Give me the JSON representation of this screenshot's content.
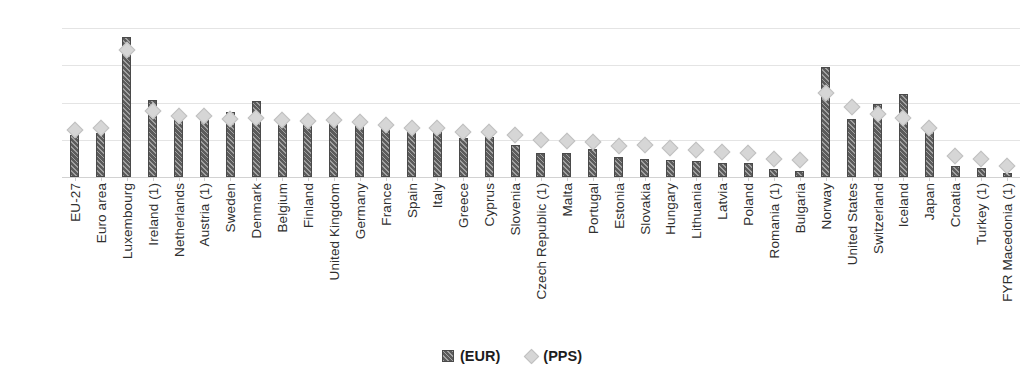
{
  "chart_data": {
    "type": "bar",
    "title": "",
    "subtitle": "",
    "xlabel": "",
    "ylabel": "",
    "ylim": [
      0,
      80000
    ],
    "grid": true,
    "legend_position": "bottom",
    "yticks": [
      "0",
      "20 000",
      "40 000",
      "60 000",
      "80 000"
    ],
    "ytick_values": [
      0,
      20000,
      40000,
      60000,
      80000
    ],
    "categories": [
      "EU-27",
      "Euro area",
      "Luxembourg",
      "Ireland (1)",
      "Netherlands",
      "Austria (1)",
      "Sweden",
      "Denmark",
      "Belgium",
      "Finland",
      "United Kingdom",
      "Germany",
      "France",
      "Spain",
      "Italy",
      "Greece",
      "Cyprus",
      "Slovenia",
      "Czech Republic (1)",
      "Malta",
      "Portugal",
      "Estonia",
      "Slovakia",
      "Hungary",
      "Lithuania",
      "Latvia",
      "Poland",
      "Romania (1)",
      "Bulgaria",
      "Norway",
      "United States",
      "Switzerland",
      "Iceland",
      "Japan",
      "Croatia",
      "Turkey (1)",
      "FYR Macedonia (1)"
    ],
    "series": [
      {
        "name": "(EUR)",
        "type": "bar",
        "color": "#5b5b5b",
        "values": [
          22500,
          23500,
          75000,
          41500,
          33000,
          31500,
          35000,
          41000,
          30000,
          31500,
          31500,
          30500,
          29000,
          26500,
          26000,
          21000,
          21500,
          17000,
          13000,
          13000,
          15000,
          10500,
          9500,
          9000,
          8500,
          7500,
          7500,
          4500,
          3000,
          59000,
          31000,
          39000,
          44500,
          26000,
          6000,
          5000,
          2200
        ]
      },
      {
        "name": "(PPS)",
        "type": "scatter",
        "marker": "diamond",
        "color": "#d6d6d6",
        "values": [
          25000,
          26500,
          68000,
          35500,
          33000,
          32500,
          31000,
          31500,
          30500,
          30000,
          30500,
          29500,
          28000,
          26500,
          26500,
          24000,
          24000,
          22500,
          20000,
          19500,
          19000,
          16500,
          17000,
          15500,
          14500,
          13500,
          13000,
          9500,
          9000,
          45000,
          37500,
          34000,
          31500,
          26500,
          11500,
          9500,
          6000
        ]
      }
    ]
  },
  "legend": {
    "items": [
      {
        "label": "(EUR)",
        "marker": "bar-hatched"
      },
      {
        "label": "(PPS)",
        "marker": "diamond"
      }
    ]
  },
  "colors": {
    "bar": "#5b5b5b",
    "bar_border": "#4a4a4a",
    "diamond": "#d6d6d6",
    "diamond_border": "#c0c0c0",
    "gridline": "#e4e4e4",
    "text": "#2f2f2f"
  }
}
